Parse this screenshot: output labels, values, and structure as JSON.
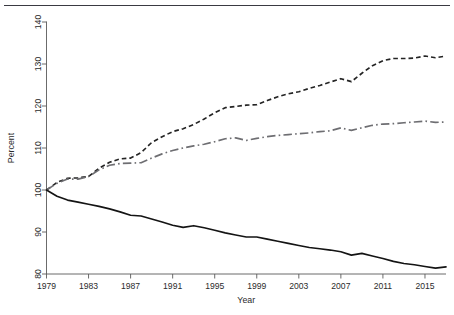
{
  "figure": {
    "background_color": "#ffffff",
    "top_rule_color": "#3a3a42"
  },
  "axis": {
    "y_title": "Percent",
    "x_title": "Year"
  },
  "chart_data": {
    "type": "line",
    "title": "",
    "subtitle": "",
    "xlabel": "Year",
    "ylabel": "Percent",
    "xlim": [
      1979,
      2017
    ],
    "ylim": [
      80,
      140
    ],
    "xticks": [
      1979,
      1983,
      1987,
      1991,
      1995,
      1999,
      2003,
      2007,
      2011,
      2015
    ],
    "yticks": [
      80,
      90,
      100,
      110,
      120,
      130,
      140
    ],
    "grid": false,
    "legend": "none",
    "x": [
      1979,
      1980,
      1981,
      1982,
      1983,
      1984,
      1985,
      1986,
      1987,
      1988,
      1989,
      1990,
      1991,
      1992,
      1993,
      1994,
      1995,
      1996,
      1997,
      1998,
      1999,
      2000,
      2001,
      2002,
      2003,
      2004,
      2005,
      2006,
      2007,
      2008,
      2009,
      2010,
      2011,
      2012,
      2013,
      2014,
      2015,
      2016,
      2017
    ],
    "series": [
      {
        "name": "upper-dashed",
        "style": "dashed",
        "color": "#242424",
        "values": [
          100.0,
          101.8,
          102.8,
          102.9,
          103.2,
          105.2,
          106.6,
          107.4,
          107.6,
          108.9,
          111.3,
          112.7,
          113.9,
          114.6,
          115.6,
          116.9,
          118.4,
          119.6,
          119.9,
          120.2,
          120.3,
          121.3,
          122.2,
          122.9,
          123.4,
          124.2,
          124.9,
          125.7,
          126.5,
          125.8,
          127.8,
          129.6,
          130.8,
          131.3,
          131.3,
          131.4,
          131.9,
          131.5,
          131.9
        ]
      },
      {
        "name": "middle-dashdot",
        "style": "dash-dot",
        "color": "#6e6e72",
        "values": [
          100.0,
          101.6,
          102.6,
          102.6,
          103.2,
          104.8,
          105.9,
          106.3,
          106.4,
          106.5,
          107.6,
          108.6,
          109.4,
          110.0,
          110.5,
          110.9,
          111.5,
          112.2,
          112.4,
          111.8,
          112.3,
          112.7,
          113.0,
          113.2,
          113.4,
          113.6,
          113.9,
          114.1,
          114.8,
          114.2,
          114.8,
          115.4,
          115.7,
          115.8,
          116.0,
          116.2,
          116.4,
          116.1,
          116.2
        ]
      },
      {
        "name": "lower-solid",
        "style": "solid",
        "color": "#141414",
        "values": [
          100.0,
          98.5,
          97.6,
          97.1,
          96.6,
          96.1,
          95.5,
          94.8,
          94.0,
          93.8,
          93.1,
          92.4,
          91.6,
          91.1,
          91.5,
          91.0,
          90.4,
          89.8,
          89.3,
          88.8,
          88.8,
          88.3,
          87.8,
          87.3,
          86.8,
          86.3,
          86.0,
          85.7,
          85.3,
          84.5,
          84.9,
          84.3,
          83.7,
          83.0,
          82.5,
          82.2,
          81.8,
          81.4,
          81.7
        ]
      }
    ]
  }
}
